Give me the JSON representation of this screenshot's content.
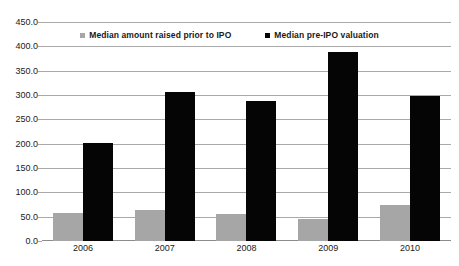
{
  "chart_data": {
    "type": "bar",
    "title": "",
    "subtitle": "",
    "xlabel": "",
    "ylabel": "",
    "categories": [
      "2006",
      "2007",
      "2008",
      "2009",
      "2010"
    ],
    "series": [
      {
        "name": "Median amount raised prior to IPO",
        "color": "#a6a6a6",
        "values": [
          57.0,
          63.0,
          56.0,
          45.0,
          73.0
        ]
      },
      {
        "name": "Median pre-IPO valuation",
        "color": "#050505",
        "values": [
          202.0,
          307.0,
          287.0,
          388.0,
          297.0
        ]
      }
    ],
    "ylim": [
      0.0,
      450.0
    ],
    "ytick_step": 50.0,
    "ytick_labels": [
      "450.0",
      "400.0",
      "350.0",
      "300.0",
      "250.0",
      "200.0",
      "150.0",
      "100.0",
      "50.0",
      "0.0"
    ],
    "ytick_values": [
      450,
      400,
      350,
      300,
      250,
      200,
      150,
      100,
      50,
      0
    ],
    "grid": true,
    "legend_position": "top-center",
    "gridline_color": "#a9a9a9",
    "background_color": "#ffffff"
  }
}
